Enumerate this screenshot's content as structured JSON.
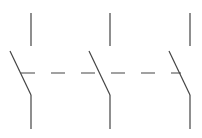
{
  "diagram": {
    "type": "three-pole-switch-symbol",
    "stroke_color": "#444444",
    "background": "#ffffff",
    "poles": [
      {
        "x": 31,
        "top": [
          13,
          46
        ],
        "blade": [
          [
            10,
            51
          ],
          [
            31,
            95
          ]
        ],
        "bottom": [
          95,
          129
        ]
      },
      {
        "x": 110,
        "top": [
          13,
          46
        ],
        "blade": [
          [
            89,
            51
          ],
          [
            110,
            95
          ]
        ],
        "bottom": [
          95,
          129
        ]
      },
      {
        "x": 190,
        "top": [
          13,
          46
        ],
        "blade": [
          [
            169,
            51
          ],
          [
            190,
            95
          ]
        ],
        "bottom": [
          95,
          129
        ]
      }
    ],
    "linkage": {
      "y": 73,
      "x1": 21,
      "x2": 181,
      "dash": "14 16"
    }
  }
}
